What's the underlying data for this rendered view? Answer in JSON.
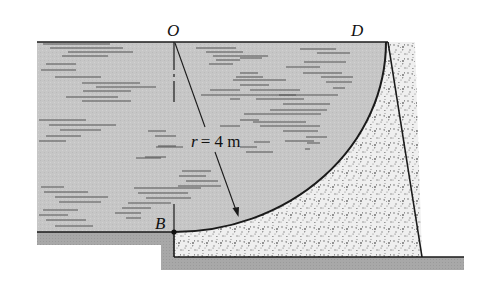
{
  "figure": {
    "labels": {
      "O": "O",
      "D": "D",
      "B": "B",
      "radius_var": "r",
      "radius_eq": "= 4 m"
    },
    "dimensions": {
      "radius_m": 4
    },
    "colors": {
      "water": "#c8c8c8",
      "ground": "#a9a9a9",
      "concrete": "#ececec",
      "line": "#1a1a1a"
    }
  }
}
